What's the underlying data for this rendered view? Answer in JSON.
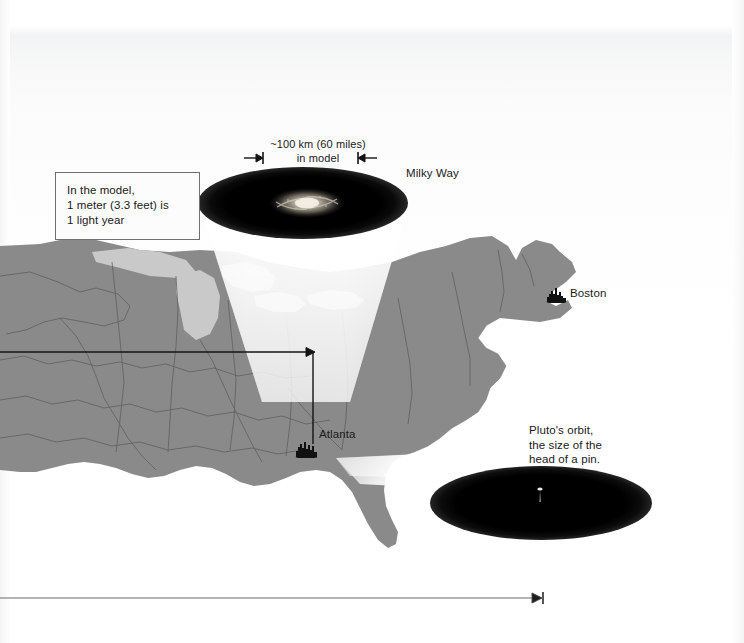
{
  "figure": {
    "type": "scale-model-diagram",
    "background_color": "#ffffff",
    "map_land_color": "#8a8a8a",
    "map_water_color": "#c9c9c9",
    "ink_color": "#1a1a1a"
  },
  "annotations": {
    "model_scale_box": "In the model,\n1 meter (3.3 feet) is\n1 light year",
    "scale_caption": "~100 km (60 miles)\nin model",
    "milkyway_label": "Milky Way",
    "pluto_note": "Pluto's orbit,\nthe size of the\nhead of a pin.",
    "city_atlanta": "Atlanta",
    "city_boston": "Boston"
  },
  "measures": {
    "milkyway_diameter_km": "~100 km",
    "milkyway_diameter_miles": "60 miles",
    "model_unit_metric": "1 meter",
    "model_unit_imperial": "3.3 feet",
    "model_unit_represents": "1 light year"
  },
  "icons": {
    "galaxy": "spiral-galaxy-icon",
    "pin": "pin-icon",
    "city_atlanta": "city-marker-icon",
    "city_boston": "city-marker-icon",
    "arrow_right": "arrow-right-icon",
    "arrow_left": "arrow-left-icon"
  }
}
